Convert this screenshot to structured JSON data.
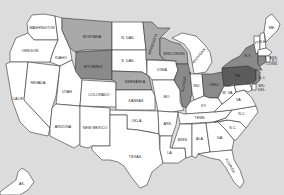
{
  "map": {
    "title": "United States",
    "background_color": "#dcdcdc",
    "colors": {
      "none": "#ffffff",
      "light": "#a9a9a9",
      "medium": "#8a8a8a",
      "dark": "#5c5c5c"
    },
    "states": [
      {
        "id": "wa",
        "label": "WASHINGTON",
        "shade": "none"
      },
      {
        "id": "or",
        "label": "OREGON",
        "shade": "none"
      },
      {
        "id": "ca",
        "label": "CALIF.",
        "shade": "none"
      },
      {
        "id": "id",
        "label": "IDAHO",
        "shade": "none"
      },
      {
        "id": "nv",
        "label": "NEVADA",
        "shade": "none"
      },
      {
        "id": "mt",
        "label": "MONTANA",
        "shade": "light"
      },
      {
        "id": "wy",
        "label": "WYOMING",
        "shade": "medium"
      },
      {
        "id": "ut",
        "label": "UTAH",
        "shade": "none"
      },
      {
        "id": "az",
        "label": "ARIZONA",
        "shade": "none"
      },
      {
        "id": "co",
        "label": "COLORADO",
        "shade": "none"
      },
      {
        "id": "nm",
        "label": "NEW MEXICO",
        "shade": "none"
      },
      {
        "id": "nd",
        "label": "N. DAK.",
        "shade": "none"
      },
      {
        "id": "sd",
        "label": "S. DAK.",
        "shade": "none"
      },
      {
        "id": "ne",
        "label": "NEBRASKA",
        "shade": "light"
      },
      {
        "id": "ks",
        "label": "KANSAS",
        "shade": "none"
      },
      {
        "id": "ok",
        "label": "OKLA.",
        "shade": "none"
      },
      {
        "id": "tx",
        "label": "TEXAS",
        "shade": "none"
      },
      {
        "id": "mn",
        "label": "MINNESOTA",
        "shade": "light"
      },
      {
        "id": "ia",
        "label": "IOWA",
        "shade": "none"
      },
      {
        "id": "mo",
        "label": "MO.",
        "shade": "none"
      },
      {
        "id": "ar",
        "label": "ARK.",
        "shade": "none"
      },
      {
        "id": "la",
        "label": "LA.",
        "shade": "none"
      },
      {
        "id": "wi",
        "label": "WISCONSIN",
        "shade": "light"
      },
      {
        "id": "il",
        "label": "ILLINOIS",
        "shade": "medium"
      },
      {
        "id": "mi",
        "label": "MICHIGAN",
        "shade": "none"
      },
      {
        "id": "in",
        "label": "IND.",
        "shade": "none"
      },
      {
        "id": "oh",
        "label": "OHIO",
        "shade": "medium"
      },
      {
        "id": "ky",
        "label": "KY.",
        "shade": "none"
      },
      {
        "id": "tn",
        "label": "TENN.",
        "shade": "none"
      },
      {
        "id": "ms",
        "label": "MISS.",
        "shade": "none"
      },
      {
        "id": "al",
        "label": "ALA.",
        "shade": "none"
      },
      {
        "id": "ga",
        "label": "GA.",
        "shade": "none"
      },
      {
        "id": "fl",
        "label": "FLORIDA",
        "shade": "none"
      },
      {
        "id": "sc",
        "label": "S.C.",
        "shade": "none"
      },
      {
        "id": "nc",
        "label": "N.C.",
        "shade": "none"
      },
      {
        "id": "va",
        "label": "VA.",
        "shade": "none"
      },
      {
        "id": "wv",
        "label": "W. VA.",
        "shade": "none"
      },
      {
        "id": "pa",
        "label": "PA.",
        "shade": "dark"
      },
      {
        "id": "ny",
        "label": "N.Y.",
        "shade": "medium"
      },
      {
        "id": "nj",
        "label": "N.J.",
        "shade": "medium"
      },
      {
        "id": "md",
        "label": "MD.",
        "shade": "none"
      },
      {
        "id": "de",
        "label": "DEL.",
        "shade": "none"
      },
      {
        "id": "vt",
        "label": "VT.",
        "shade": "none"
      },
      {
        "id": "nh",
        "label": "N.H.",
        "shade": "none"
      },
      {
        "id": "me",
        "label": "ME.",
        "shade": "none"
      },
      {
        "id": "ma",
        "label": "MASS.",
        "shade": "none"
      },
      {
        "id": "ct",
        "label": "CONN.",
        "shade": "medium"
      },
      {
        "id": "ri",
        "label": "R.I.",
        "shade": "none"
      },
      {
        "id": "ak",
        "label": "AK.",
        "shade": "none"
      }
    ]
  }
}
